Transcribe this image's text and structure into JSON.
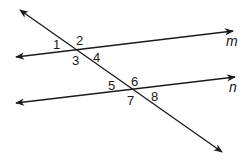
{
  "diagram": {
    "stroke_color": "#1a1a1a",
    "lines": [
      {
        "id": "transversal",
        "label": "",
        "x1": 20,
        "y1": 10,
        "x2": 222,
        "y2": 152
      },
      {
        "id": "m",
        "label": "m",
        "x1": 16,
        "y1": 57,
        "x2": 233,
        "y2": 31,
        "label_x": 226,
        "label_y": 46
      },
      {
        "id": "n",
        "label": "n",
        "x1": 16,
        "y1": 103,
        "x2": 235,
        "y2": 77,
        "label_x": 229,
        "label_y": 92
      }
    ],
    "angles": [
      {
        "label": "1",
        "x": 53,
        "y": 49
      },
      {
        "label": "2",
        "x": 76,
        "y": 45
      },
      {
        "label": "3",
        "x": 72,
        "y": 65
      },
      {
        "label": "4",
        "x": 93,
        "y": 62
      },
      {
        "label": "5",
        "x": 108,
        "y": 90
      },
      {
        "label": "6",
        "x": 131,
        "y": 86
      },
      {
        "label": "7",
        "x": 127,
        "y": 105
      },
      {
        "label": "8",
        "x": 151,
        "y": 101
      }
    ]
  }
}
